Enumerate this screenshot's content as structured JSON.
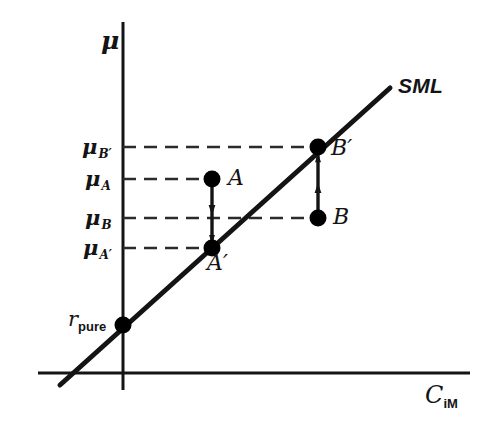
{
  "figure": {
    "colors": {
      "line": "#141414",
      "dash": "#2b2b2b",
      "background": "#ffffff",
      "point": "#000000"
    }
  },
  "axes": {
    "y_label": "μ",
    "x_label": "C",
    "x_label_sub": "iM",
    "x_axis_y": 373,
    "y_axis_x": 123
  },
  "sml": {
    "label": "SML",
    "x1": 60,
    "y1": 385,
    "x2": 390,
    "y2": 88
  },
  "tick_labels": [
    {
      "name": "mu-b-prime",
      "base": "μ",
      "sub": "B′",
      "y": 147
    },
    {
      "name": "mu-a",
      "base": "μ",
      "sub": "A",
      "y": 179
    },
    {
      "name": "mu-b",
      "base": "μ",
      "sub": "B",
      "y": 218
    },
    {
      "name": "mu-a-prime",
      "base": "μ",
      "sub": "A′",
      "y": 248
    }
  ],
  "intercept": {
    "base": "r",
    "sub": "pure",
    "x": 123,
    "y": 325
  },
  "points": [
    {
      "name": "A",
      "label": "A",
      "x": 212,
      "y": 179,
      "on_sml": false
    },
    {
      "name": "A-prime",
      "label": "A′",
      "x": 212,
      "y": 248,
      "on_sml": true
    },
    {
      "name": "B",
      "label": "B",
      "x": 318,
      "y": 218,
      "on_sml": false
    },
    {
      "name": "B-prime",
      "label": "B′",
      "x": 318,
      "y": 147,
      "on_sml": true
    }
  ],
  "arrows": [
    {
      "name": "arrow-a-to-a-prime",
      "from": "A",
      "to": "A′",
      "direction": "down",
      "x": 212,
      "y_start": 179,
      "y_end": 248
    },
    {
      "name": "arrow-b-to-b-prime",
      "from": "B",
      "to": "B′",
      "direction": "up",
      "x": 318,
      "y_start": 218,
      "y_end": 147
    }
  ],
  "dashed_guides": [
    {
      "name": "guide-mu-b-prime",
      "y": 147,
      "x1": 123,
      "x2": 318
    },
    {
      "name": "guide-mu-a",
      "y": 179,
      "x1": 123,
      "x2": 212
    },
    {
      "name": "guide-mu-b",
      "y": 218,
      "x1": 123,
      "x2": 318
    },
    {
      "name": "guide-mu-a-prime",
      "y": 248,
      "x1": 123,
      "x2": 212
    }
  ]
}
